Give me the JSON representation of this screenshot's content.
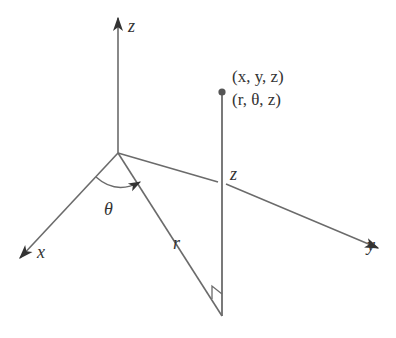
{
  "diagram": {
    "axes": {
      "z_label": "z",
      "x_label": "x",
      "y_label": "y"
    },
    "point": {
      "cartesian": "(x, y, z)",
      "cylindrical": "(r, θ, z)"
    },
    "labels": {
      "theta": "θ",
      "r": "r",
      "height_z": "z"
    },
    "colors": {
      "line": "#6b6b6b",
      "point": "#555555",
      "text": "#333333"
    }
  }
}
